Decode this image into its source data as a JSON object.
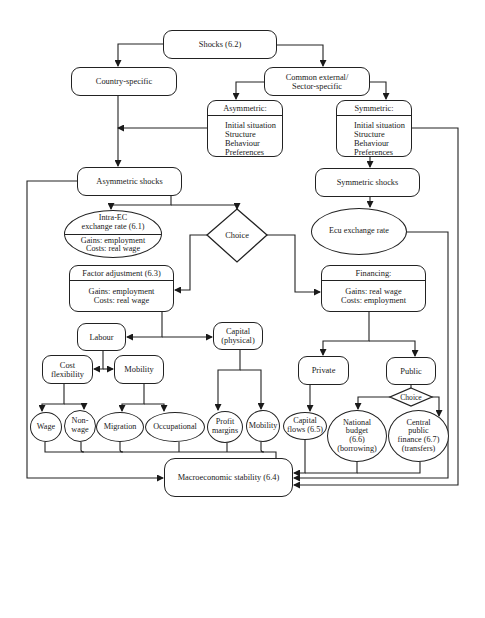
{
  "diagram": {
    "type": "flowchart",
    "nodes": {
      "shocks": "Shocks (6.2)",
      "country_specific": "Country-specific",
      "common_external": [
        "Common external/",
        "Sector-specific"
      ],
      "asymmetric": {
        "header": "Asymmetric:",
        "items": [
          "Initial situation",
          "Structure",
          "Behaviour",
          "Preferences"
        ]
      },
      "symmetric": {
        "header": "Symmetric:",
        "items": [
          "Initial situation",
          "Structure",
          "Behaviour",
          "Preferences"
        ]
      },
      "asymmetric_shocks": "Asymmetric shocks",
      "symmetric_shocks": "Symmetric shocks",
      "intra_ec": {
        "header": [
          "Intra-EC",
          "exchange rate (6.1)"
        ],
        "body": [
          "Gains: employment",
          "Costs: real wage"
        ]
      },
      "choice_main": "Choice",
      "ecu_exchange_rate": "Ecu exchange rate",
      "factor_adjustment": {
        "header": "Factor adjustment (6.3)",
        "body": [
          "Gains: employment",
          "Costs: real wage"
        ]
      },
      "financing": {
        "header": "Financing:",
        "body": [
          "Gains: real wage",
          "Costs: employment"
        ]
      },
      "labour": "Labour",
      "capital": [
        "Capital",
        "(physical)"
      ],
      "cost_flexibility": [
        "Cost",
        "flexibility"
      ],
      "mobility_labour": "Mobility",
      "private": "Private",
      "public": "Public",
      "choice_public": "Choice",
      "wage": "Wage",
      "non_wage": [
        "Non-",
        "wage"
      ],
      "migration": "Migration",
      "occupational": "Occupational",
      "profit_margins": [
        "Profit",
        "margins"
      ],
      "mobility_capital": "Mobility",
      "capital_flows": [
        "Capital",
        "flows (6.5)"
      ],
      "national_budget": [
        "National",
        "budget",
        "(6.6)",
        "(borrowing)"
      ],
      "central_public_finance": [
        "Central",
        "public",
        "finance (6.7)",
        "(transfers)"
      ],
      "macroeconomic_stability": "Macroeconomic stability (6.4)"
    },
    "edges": [
      [
        "shocks",
        "country_specific"
      ],
      [
        "shocks",
        "common_external"
      ],
      [
        "common_external",
        "asymmetric"
      ],
      [
        "common_external",
        "symmetric"
      ],
      [
        "asymmetric",
        "asymmetric_shocks"
      ],
      [
        "country_specific",
        "asymmetric_shocks"
      ],
      [
        "symmetric",
        "symmetric_shocks"
      ],
      [
        "symmetric_shocks",
        "ecu_exchange_rate"
      ],
      [
        "asymmetric_shocks",
        "intra_ec"
      ],
      [
        "asymmetric_shocks",
        "choice_main"
      ],
      [
        "choice_main",
        "factor_adjustment"
      ],
      [
        "choice_main",
        "financing"
      ],
      [
        "factor_adjustment",
        "labour"
      ],
      [
        "factor_adjustment",
        "capital"
      ],
      [
        "labour",
        "cost_flexibility"
      ],
      [
        "labour",
        "mobility_labour"
      ],
      [
        "cost_flexibility",
        "wage"
      ],
      [
        "cost_flexibility",
        "non_wage"
      ],
      [
        "mobility_labour",
        "migration"
      ],
      [
        "mobility_labour",
        "occupational"
      ],
      [
        "capital",
        "profit_margins"
      ],
      [
        "capital",
        "mobility_capital"
      ],
      [
        "financing",
        "private"
      ],
      [
        "financing",
        "public"
      ],
      [
        "private",
        "capital_flows"
      ],
      [
        "public",
        "choice_public"
      ],
      [
        "choice_public",
        "national_budget"
      ],
      [
        "choice_public",
        "central_public_finance"
      ],
      [
        "wage",
        "macroeconomic_stability"
      ],
      [
        "non_wage",
        "macroeconomic_stability"
      ],
      [
        "migration",
        "macroeconomic_stability"
      ],
      [
        "occupational",
        "macroeconomic_stability"
      ],
      [
        "profit_margins",
        "macroeconomic_stability"
      ],
      [
        "mobility_capital",
        "macroeconomic_stability"
      ],
      [
        "asymmetric_shocks",
        "macroeconomic_stability"
      ],
      [
        "capital_flows",
        "macroeconomic_stability"
      ],
      [
        "national_budget",
        "macroeconomic_stability"
      ],
      [
        "central_public_finance",
        "macroeconomic_stability"
      ],
      [
        "ecu_exchange_rate",
        "macroeconomic_stability"
      ],
      [
        "symmetric",
        "macroeconomic_stability"
      ]
    ]
  }
}
